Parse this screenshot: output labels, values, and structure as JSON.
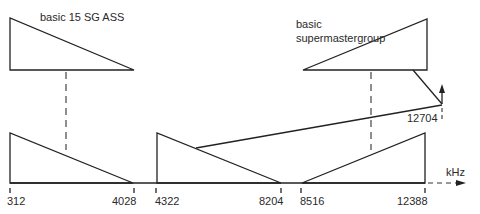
{
  "labels": {
    "top_left": "basic 15 SG ASS",
    "top_right_line1": "basic",
    "top_right_line2": "supermastergroup",
    "carrier": "12704",
    "axis_unit": "kHz"
  },
  "axis_ticks": [
    "312",
    "4028",
    "4322",
    "8204",
    "8516",
    "12388"
  ],
  "colors": {
    "line": "#222222",
    "text": "#2a2a2a",
    "background": "#ffffff"
  }
}
